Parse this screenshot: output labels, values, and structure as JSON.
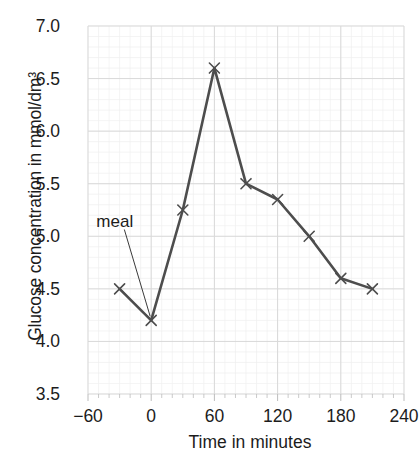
{
  "chart_data": {
    "type": "line",
    "title": "",
    "xlabel": "Time in minutes",
    "ylabel": "Glucose concentration in mmol/dm³",
    "x": [
      -30,
      0,
      30,
      60,
      90,
      120,
      150,
      180,
      210
    ],
    "values": [
      4.5,
      4.2,
      5.25,
      6.6,
      5.5,
      5.35,
      5.0,
      4.6,
      4.5
    ],
    "series": [
      {
        "name": "Blood glucose concentration",
        "values": [
          4.5,
          4.2,
          5.25,
          6.6,
          5.5,
          5.35,
          5.0,
          4.6,
          4.5
        ]
      }
    ],
    "xlim": [
      -60,
      240
    ],
    "ylim": [
      3.5,
      7.0
    ],
    "xticks": [
      -60,
      0,
      60,
      120,
      180,
      240
    ],
    "xtick_labels": [
      "−60",
      "0",
      "60",
      "120",
      "180",
      "240"
    ],
    "yticks": [
      3.5,
      4.0,
      4.5,
      5.0,
      5.5,
      6.0,
      6.5,
      7.0
    ],
    "ytick_labels": [
      "3.5",
      "4.0",
      "4.5",
      "5.0",
      "5.5",
      "6.0",
      "6.5",
      "7.0"
    ],
    "grid": true,
    "grid_minor": true,
    "grid_minor_step_x": 10,
    "grid_minor_step_y": 0.1,
    "legend": false,
    "legend_position": "none",
    "marker": "x",
    "line_color": "#4d4d4d",
    "marker_color": "#4d4d4d",
    "grid_color": "#e6e6e6",
    "annotations": [
      {
        "text": "meal",
        "target_x": 0,
        "target_y": 4.2,
        "label_x": -35,
        "label_y": 5.15
      }
    ]
  },
  "colors": {
    "background": "#ffffff",
    "text": "#1c1c1c",
    "line": "#4d4d4d",
    "grid": "#e6e6e6"
  }
}
